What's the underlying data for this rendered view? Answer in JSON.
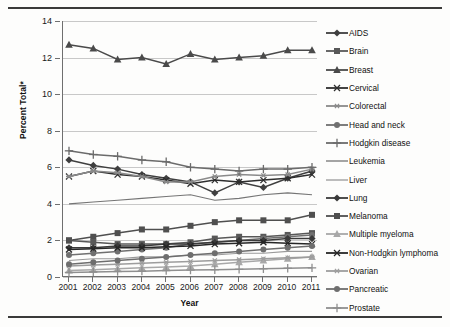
{
  "chart_data": {
    "type": "line",
    "title": "",
    "xlabel": "Year",
    "ylabel": "Percent Total*",
    "x": [
      2001,
      2002,
      2003,
      2004,
      2005,
      2006,
      2007,
      2008,
      2009,
      2010,
      2011
    ],
    "xticklabels": [
      "2001",
      "2002",
      "2003",
      "2004",
      "2005",
      "2006",
      "2007",
      "2008",
      "2009",
      "2010",
      "2011"
    ],
    "yticklabels": [
      "0",
      "2",
      "4",
      "6",
      "8",
      "10",
      "12",
      "14"
    ],
    "ylim": [
      0,
      14
    ],
    "ytick_step": 2,
    "grid": "horizontal",
    "legend_position": "right",
    "series": [
      {
        "name": "AIDS",
        "marker": "diamond",
        "color": "#3f3f3f",
        "values": [
          6.4,
          6.1,
          5.9,
          5.6,
          5.4,
          5.2,
          4.6,
          5.2,
          4.9,
          5.4,
          5.8
        ]
      },
      {
        "name": "Brain",
        "marker": "square",
        "color": "#585858",
        "values": [
          2.0,
          1.9,
          1.8,
          1.8,
          1.8,
          1.9,
          2.1,
          2.2,
          2.2,
          2.3,
          2.4
        ]
      },
      {
        "name": "Breast",
        "marker": "triangle",
        "color": "#4a4a4a",
        "values": [
          12.7,
          12.5,
          11.9,
          12.0,
          11.65,
          12.2,
          11.9,
          12.0,
          12.1,
          12.4,
          12.4
        ]
      },
      {
        "name": "Cervical",
        "marker": "cross",
        "color": "#2e2e2e",
        "values": [
          5.5,
          5.8,
          5.6,
          5.5,
          5.3,
          5.1,
          5.3,
          5.2,
          5.3,
          5.4,
          5.6
        ]
      },
      {
        "name": "Colorectal",
        "marker": "asterisk",
        "color": "#8a8a8a",
        "values": [
          5.5,
          5.8,
          5.7,
          5.5,
          5.2,
          5.2,
          5.5,
          5.6,
          5.55,
          5.6,
          5.9
        ]
      },
      {
        "name": "Head and neck",
        "marker": "circle",
        "color": "#707070",
        "values": [
          1.2,
          1.3,
          1.4,
          1.5,
          1.6,
          1.8,
          1.9,
          2.0,
          2.1,
          2.2,
          2.3
        ]
      },
      {
        "name": "Hodgkin disease",
        "marker": "plus",
        "color": "#6b6b6b",
        "values": [
          6.9,
          6.7,
          6.6,
          6.4,
          6.3,
          6.0,
          5.9,
          5.8,
          5.9,
          5.9,
          6.0
        ]
      },
      {
        "name": "Leukemia",
        "marker": "none",
        "color": "#757575",
        "values": [
          4.0,
          4.1,
          4.2,
          4.3,
          4.4,
          4.5,
          4.2,
          4.3,
          4.5,
          4.6,
          4.5
        ]
      },
      {
        "name": "Liver",
        "marker": "none",
        "color": "#9a9a9a",
        "values": [
          0.9,
          1.0,
          1.0,
          1.1,
          1.1,
          1.2,
          1.2,
          1.3,
          1.3,
          1.4,
          1.4
        ]
      },
      {
        "name": "Lung",
        "marker": "diamond",
        "color": "#3a3a3a",
        "values": [
          1.6,
          1.6,
          1.7,
          1.7,
          1.8,
          1.8,
          1.9,
          2.0,
          2.0,
          2.1,
          2.1
        ]
      },
      {
        "name": "Melanoma",
        "marker": "square",
        "color": "#4f4f4f",
        "values": [
          2.0,
          2.2,
          2.4,
          2.6,
          2.6,
          2.8,
          3.0,
          3.1,
          3.1,
          3.1,
          3.4
        ]
      },
      {
        "name": "Multiple myeloma",
        "marker": "triangle",
        "color": "#a8a8a8",
        "values": [
          0.35,
          0.4,
          0.45,
          0.5,
          0.55,
          0.6,
          0.7,
          0.8,
          0.9,
          1.0,
          1.1
        ]
      },
      {
        "name": "Non-Hodgkin lymphoma",
        "marker": "cross",
        "color": "#262626",
        "values": [
          1.5,
          1.55,
          1.6,
          1.6,
          1.65,
          1.7,
          1.8,
          1.85,
          1.9,
          1.85,
          1.8
        ]
      },
      {
        "name": "Ovarian",
        "marker": "asterisk",
        "color": "#9d9d9d",
        "values": [
          0.6,
          0.65,
          0.7,
          0.75,
          0.8,
          0.85,
          0.9,
          0.95,
          1.0,
          1.05,
          1.1
        ]
      },
      {
        "name": "Pancreatic",
        "marker": "circle",
        "color": "#6e6e6e",
        "values": [
          0.7,
          0.8,
          0.9,
          1.0,
          1.1,
          1.2,
          1.3,
          1.4,
          1.5,
          1.6,
          1.7
        ]
      },
      {
        "name": "Prostate",
        "marker": "plus",
        "color": "#8f8f8f",
        "values": [
          0.25,
          0.28,
          0.3,
          0.32,
          0.35,
          0.38,
          0.4,
          0.42,
          0.45,
          0.48,
          0.5
        ]
      }
    ]
  },
  "axes": {
    "y_title": "Percent Total*",
    "x_title": "Year"
  }
}
